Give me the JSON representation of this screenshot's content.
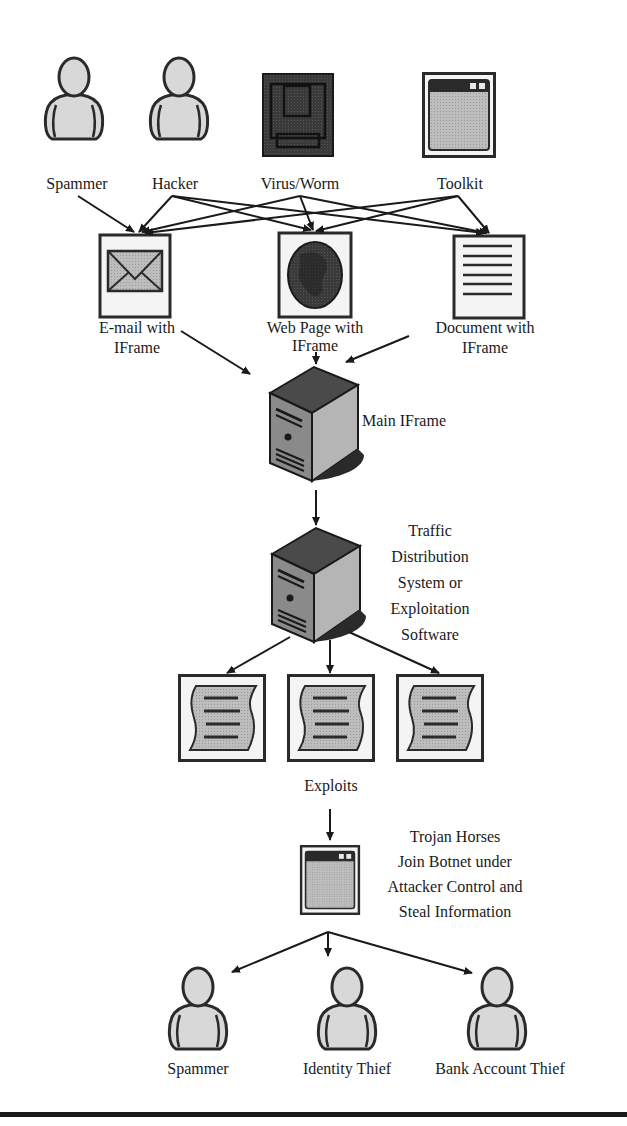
{
  "sources": [
    {
      "id": "spammer",
      "label": "Spammer",
      "icon": "person-icon"
    },
    {
      "id": "hacker",
      "label": "Hacker",
      "icon": "person-icon"
    },
    {
      "id": "virus",
      "label": "Virus/Worm",
      "icon": "virus-icon"
    },
    {
      "id": "toolkit",
      "label": "Toolkit",
      "icon": "window-icon"
    }
  ],
  "vectors": [
    {
      "id": "email",
      "label_line1": "E-mail with",
      "label_line2": "IFrame",
      "icon": "envelope-icon"
    },
    {
      "id": "webpage",
      "label_line1": "Web Page with",
      "label_line2": "IFrame",
      "icon": "globe-icon"
    },
    {
      "id": "document",
      "label_line1": "Document with",
      "label_line2": "IFrame",
      "icon": "document-icon"
    }
  ],
  "main_iframe": {
    "label": "Main IFrame",
    "icon": "server-icon"
  },
  "tds": {
    "label_lines": [
      "Traffic",
      "Distribution",
      "System or",
      "Exploitation",
      "Software"
    ],
    "icon": "server-icon"
  },
  "exploits": {
    "label": "Exploits",
    "count": 3,
    "icon": "exploit-page-icon"
  },
  "trojan": {
    "label_lines": [
      "Trojan Horses",
      "Join Botnet under",
      "Attacker Control and",
      "Steal Information"
    ],
    "icon": "window-icon"
  },
  "outcomes": [
    {
      "id": "spammer2",
      "label": "Spammer",
      "icon": "person-icon"
    },
    {
      "id": "identity",
      "label": "Identity Thief",
      "icon": "person-icon"
    },
    {
      "id": "bank",
      "label": "Bank Account Thief",
      "icon": "person-icon"
    }
  ],
  "edges": [
    [
      "Spammer",
      "E-mail with IFrame"
    ],
    [
      "Hacker",
      "E-mail with IFrame"
    ],
    [
      "Hacker",
      "Web Page with IFrame"
    ],
    [
      "Hacker",
      "Document with IFrame"
    ],
    [
      "Virus/Worm",
      "E-mail with IFrame"
    ],
    [
      "Virus/Worm",
      "Web Page with IFrame"
    ],
    [
      "Virus/Worm",
      "Document with IFrame"
    ],
    [
      "Toolkit",
      "E-mail with IFrame"
    ],
    [
      "Toolkit",
      "Web Page with IFrame"
    ],
    [
      "Toolkit",
      "Document with IFrame"
    ],
    [
      "E-mail with IFrame",
      "Main IFrame"
    ],
    [
      "Web Page with IFrame",
      "Main IFrame"
    ],
    [
      "Document with IFrame",
      "Main IFrame"
    ],
    [
      "Main IFrame",
      "Traffic Distribution System or Exploitation Software"
    ],
    [
      "Traffic Distribution System or Exploitation Software",
      "Exploits"
    ],
    [
      "Exploits",
      "Trojan Horses"
    ],
    [
      "Trojan Horses",
      "Spammer"
    ],
    [
      "Trojan Horses",
      "Identity Thief"
    ],
    [
      "Trojan Horses",
      "Bank Account Thief"
    ]
  ]
}
